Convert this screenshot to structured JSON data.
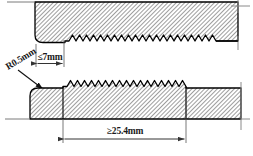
{
  "drawing": {
    "title": "Serrated jaw profile cross-section detail",
    "background_color": "#ffffff",
    "line_color": "#000000",
    "hatch_color": "#555555",
    "dimension_color": "#333333",
    "annotations": {
      "flat_land_width": {
        "label": "≤7mm",
        "name": "flat-land-width-dimension",
        "kind": "linear-dimension",
        "position": "upper-left",
        "value": 7,
        "unit": "mm",
        "qualifier": "less-than-or-equal"
      },
      "corner_radius": {
        "label": "R0.5mm",
        "name": "corner-radius-callout",
        "kind": "radius-leader",
        "position": "left",
        "value": 0.5,
        "unit": "mm",
        "rotation_deg": -30
      },
      "serration_length": {
        "label": "≥25.4mm",
        "name": "serration-length-dimension",
        "kind": "linear-dimension",
        "position": "bottom",
        "value": 25.4,
        "unit": "mm",
        "qualifier": "greater-than-or-equal"
      }
    },
    "geometry": {
      "upper_jaw": {
        "name": "upper-jaw-body",
        "teeth_count": 15,
        "tooth_direction": "down",
        "hatched": true
      },
      "lower_jaw": {
        "name": "lower-jaw-body",
        "teeth_count": 15,
        "tooth_direction": "up",
        "hatched": true
      },
      "centerlines": [
        {
          "name": "centerline-right-upper",
          "orientation": "vertical"
        },
        {
          "name": "centerline-right-lower",
          "orientation": "vertical"
        },
        {
          "name": "centerline-left-lower",
          "orientation": "horizontal"
        }
      ]
    }
  }
}
